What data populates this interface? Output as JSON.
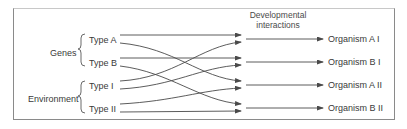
{
  "header": {
    "line1": "Developmental",
    "line2": "interactions"
  },
  "groups": [
    {
      "label": "Genes",
      "types": [
        "Type A",
        "Type B"
      ]
    },
    {
      "label": "Environment",
      "types": [
        "Type I",
        "Type II"
      ]
    }
  ],
  "outcomes": [
    "Organism A I",
    "Organism B I",
    "Organism A II",
    "Organism B II"
  ],
  "connections": [
    {
      "from": "Type A",
      "to": "Organism A I"
    },
    {
      "from": "Type A",
      "to": "Organism A II"
    },
    {
      "from": "Type B",
      "to": "Organism B I"
    },
    {
      "from": "Type B",
      "to": "Organism B II"
    },
    {
      "from": "Type I",
      "to": "Organism A I"
    },
    {
      "from": "Type I",
      "to": "Organism B I"
    },
    {
      "from": "Type II",
      "to": "Organism A II"
    },
    {
      "from": "Type II",
      "to": "Organism B II"
    }
  ],
  "colors": {
    "line": "#4a4a4a",
    "border": "#8a8a8a",
    "text": "#3a3a3a"
  }
}
